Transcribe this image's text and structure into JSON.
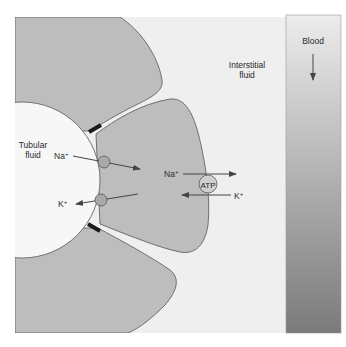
{
  "figure": {
    "regions": {
      "tubular_fluid": {
        "line1": "Tubular",
        "line2": "fluid"
      },
      "interstitial_fluid": {
        "line1": "Interstitial",
        "line2": "fluid"
      },
      "blood": {
        "label": "Blood",
        "flow_direction": "down"
      }
    },
    "apical_transport": [
      {
        "ion": "Na",
        "charge": "+",
        "direction": "into cell",
        "carrier": "apical-channel"
      },
      {
        "ion": "K",
        "charge": "+",
        "direction": "out of cell",
        "carrier": "apical-channel"
      }
    ],
    "basolateral_pump": {
      "label": "ATP",
      "na": {
        "ion": "Na",
        "charge": "+",
        "direction": "out to interstitium"
      },
      "k": {
        "ion": "K",
        "charge": "+",
        "direction": "into cell"
      }
    },
    "colors": {
      "cell_fill": "#bdbdbd",
      "interstitial_fill": "#eeeeee",
      "lumen_fill": "#f7f7f7",
      "membrane_stroke": "#555555",
      "tight_junction": "#1a1a1a",
      "carrier_fill": "#a9a9a9",
      "blood_top": "#e9e9e9",
      "blood_bottom": "#7c7c7c"
    }
  }
}
